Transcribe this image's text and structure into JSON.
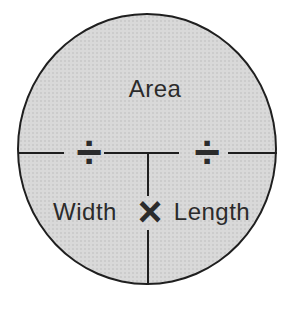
{
  "diagram": {
    "type": "formula-circle",
    "labels": {
      "top": "Area",
      "bottom_left": "Width",
      "bottom_right": "Length"
    },
    "operators": {
      "divide_left": "÷",
      "divide_right": "÷",
      "multiply": "×"
    },
    "icons": {
      "divide_left": "divide-icon",
      "divide_right": "divide-icon",
      "multiply": "multiply-icon"
    },
    "colors": {
      "circle_fill": "#d9d9d9",
      "line": "#1f1f1f",
      "text": "#2b2b2b",
      "background": "#ffffff"
    }
  }
}
